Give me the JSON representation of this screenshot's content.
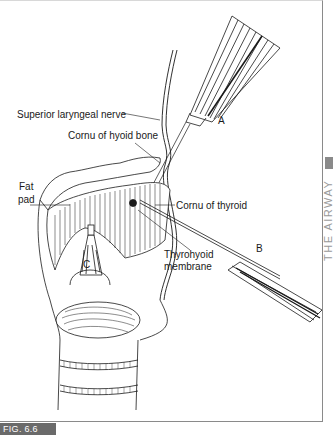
{
  "figure": {
    "caption": "FIG. 6.6",
    "side_tab_text": "THE AIRWAY",
    "labels": {
      "superior_laryngeal_nerve": "Superior laryngeal nerve",
      "cornu_hyoid": "Cornu of hyoid bone",
      "fat_pad_1": "Fat",
      "fat_pad_2": "pad",
      "cornu_thyroid": "Cornu of thyroid",
      "thyrohyoid_1": "Thyrohyoid",
      "thyrohyoid_2": "membrane",
      "needle_a": "A",
      "needle_b": "B",
      "needle_c": "C"
    },
    "colors": {
      "line": "#1a1a1a",
      "caption_bg": "#6a6a6a",
      "frame": "#8a8a8a"
    }
  }
}
